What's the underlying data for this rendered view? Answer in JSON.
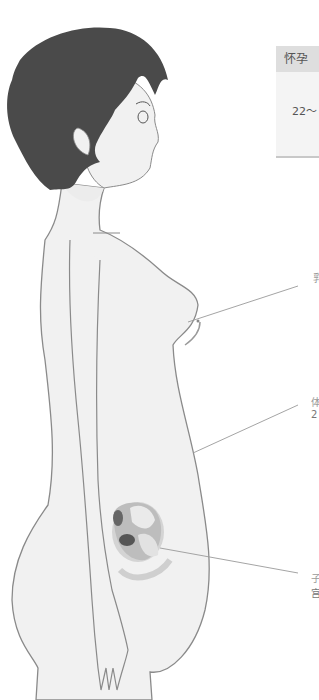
{
  "table": {
    "header": "怀孕",
    "value": "22～"
  },
  "labels": [
    {
      "id": "breast",
      "line1": "乳",
      "line2": ""
    },
    {
      "id": "belly",
      "line1": "体",
      "line2": "2"
    },
    {
      "id": "uterus",
      "line1": "子",
      "line2": "宫"
    }
  ],
  "colors": {
    "hair": "#4a4a4a",
    "skin": "#f1f1f1",
    "outline": "#8a8a8a",
    "leader": "#9a9a9a",
    "table_header_bg": "#dedede",
    "table_body_bg": "#f4f4f4"
  }
}
